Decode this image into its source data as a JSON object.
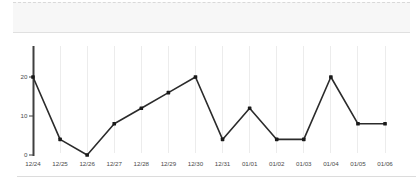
{
  "chart_data": {
    "type": "line",
    "categories": [
      "12/24",
      "12/25",
      "12/26",
      "12/27",
      "12/28",
      "12/29",
      "12/30",
      "12/31",
      "01/01",
      "01/02",
      "01/03",
      "01/04",
      "01/05",
      "01/06"
    ],
    "values": [
      20,
      4,
      0,
      8,
      12,
      16,
      20,
      4,
      12,
      4,
      4,
      20,
      8,
      8
    ],
    "yticks": [
      0,
      10,
      20
    ],
    "ylim": [
      0,
      28
    ],
    "grid": true,
    "legend": false
  },
  "colors": {
    "line": "#2b2b2b",
    "point": "#1a1a1a",
    "axis": "#3f3f3f",
    "grid": "#ececec",
    "label": "#4a4a4a",
    "band_bg": "#f7f7f7",
    "band_border": "#dcdcdc",
    "background": "#ffffff"
  }
}
